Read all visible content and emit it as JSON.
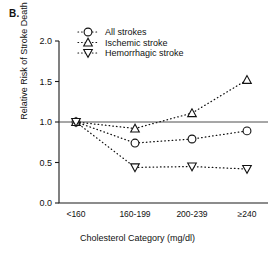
{
  "figure": {
    "panel_label": "B.",
    "y_axis_title": "Relative Risk of Stroke Death",
    "x_axis_title": "Cholesterol Category (mg/dl)"
  },
  "axis": {
    "y_ticks": [
      "0.0",
      "0.5",
      "1.0",
      "1.5",
      "2.0"
    ],
    "x_ticks": [
      "<160",
      "160-199",
      "200-239",
      "≥240"
    ]
  },
  "legend": {
    "items": [
      {
        "label": "All strokes",
        "marker": "circle-open-icon"
      },
      {
        "label": "Ischemic stroke",
        "marker": "triangle-up-open-icon"
      },
      {
        "label": "Hemorrhagic stroke",
        "marker": "triangle-down-open-icon"
      }
    ]
  },
  "colors": {
    "ink": "#111111",
    "reference_line": "#3a3a3a",
    "marker_fill": "#ffffff",
    "background": "#ffffff"
  },
  "chart_data": {
    "type": "line",
    "title": "B.",
    "xlabel": "Cholesterol Category (mg/dl)",
    "ylabel": "Relative Risk of Stroke Death",
    "categories": [
      "<160",
      "160-199",
      "200-239",
      "≥240"
    ],
    "ylim": [
      0.0,
      2.0
    ],
    "ytick_step": 0.5,
    "grid": false,
    "legend_position": "top-center",
    "reference_line": {
      "y": 1.0,
      "style": "solid"
    },
    "series": [
      {
        "name": "All strokes",
        "marker": "circle-open",
        "linestyle": "dotted",
        "values": [
          1.0,
          0.74,
          0.79,
          0.89
        ]
      },
      {
        "name": "Ischemic stroke",
        "marker": "triangle-up-open",
        "linestyle": "dotted",
        "values": [
          1.0,
          0.92,
          1.11,
          1.52
        ]
      },
      {
        "name": "Hemorrhagic stroke",
        "marker": "triangle-down-open",
        "linestyle": "dotted",
        "values": [
          1.0,
          0.44,
          0.45,
          0.42
        ]
      }
    ]
  }
}
